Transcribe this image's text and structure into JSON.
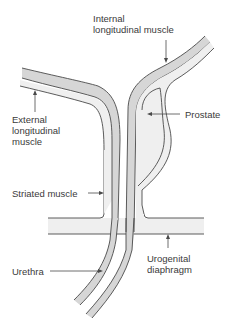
{
  "diagram": {
    "labels": {
      "internal_longitudinal_muscle": {
        "line1": "Internal",
        "line2": "longitudinal muscle"
      },
      "external_longitudinal_muscle": {
        "line1": "External",
        "line2": "longitudinal",
        "line3": "muscle"
      },
      "prostate": "Prostate",
      "striated_muscle": "Striated muscle",
      "urethra": "Urethra",
      "urogenital_diaphragm": {
        "line1": "Urogenital",
        "line2": "diaphragm"
      }
    },
    "colors": {
      "muscle_band": "#d6d6d6",
      "outer_layer": "#efefef",
      "outline": "#4a4a4a",
      "text": "#3a3a3a"
    }
  }
}
